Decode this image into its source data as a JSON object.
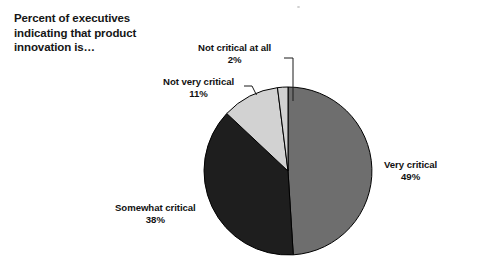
{
  "title": "Percent of executives\nindicating that product\ninnovation is…",
  "chart_data": {
    "type": "pie",
    "title": "Percent of executives indicating that product innovation is…",
    "xlabel": "",
    "ylabel": "",
    "units": "percent",
    "start_angle_deg": 0,
    "direction": "clockwise",
    "legend": "none (direct labels with leader lines)",
    "grid": false,
    "categories": [
      "Very critical",
      "Somewhat critical",
      "Not very critical",
      "Not critical at all"
    ],
    "values": [
      49,
      38,
      11,
      2
    ],
    "labels": [
      "49%",
      "38%",
      "11%",
      "2%"
    ],
    "colors": [
      "#6e6e6e",
      "#1e1e1e",
      "#d2d2d2",
      "#d2d2d2"
    ],
    "slices": [
      {
        "name": "Very critical",
        "value": 49,
        "value_label": "49%",
        "color": "#6e6e6e",
        "label_position": "right-outside"
      },
      {
        "name": "Somewhat critical",
        "value": 38,
        "value_label": "38%",
        "color": "#1e1e1e",
        "label_position": "bottom-left-outside"
      },
      {
        "name": "Not very critical",
        "value": 11,
        "value_label": "11%",
        "color": "#d2d2d2",
        "label_position": "upper-left-outside"
      },
      {
        "name": "Not critical at all",
        "value": 2,
        "value_label": "2%",
        "color": "#d2d2d2",
        "label_position": "top-outside"
      }
    ]
  },
  "labels": {
    "not_critical_at_all": {
      "name": "Not critical at all",
      "value": "2%"
    },
    "not_very_critical": {
      "name": "Not very critical",
      "value": "11%"
    },
    "very_critical": {
      "name": "Very critical",
      "value": "49%"
    },
    "somewhat_critical": {
      "name": "Somewhat critical",
      "value": "38%"
    }
  }
}
